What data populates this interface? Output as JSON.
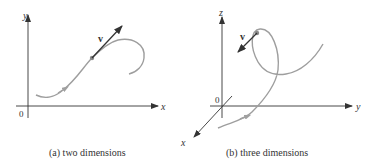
{
  "panels": [
    {
      "id": "a",
      "caption": "(a)  two dimensions",
      "axes": {
        "x_label": "x",
        "y_label": "y",
        "origin_label": "0"
      },
      "vector_label": "v"
    },
    {
      "id": "b",
      "caption": "(b)  three dimensions",
      "axes": {
        "x_label": "x",
        "y_label": "y",
        "z_label": "z",
        "origin_label": "0"
      },
      "vector_label": "v"
    }
  ],
  "colors": {
    "axis": "#333333",
    "curve": "#9a9a9a",
    "vector": "#333333",
    "point": "#888888"
  }
}
